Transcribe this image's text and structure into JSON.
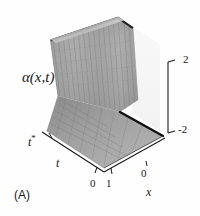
{
  "figure": {
    "caption": "(A)",
    "value_label": "α(x,t)",
    "background_color": "#fefefe",
    "axis_color": "#1a1a1a"
  },
  "axes": {
    "x": {
      "label": "x",
      "ticks": [
        "0"
      ],
      "front_tick": "1"
    },
    "t": {
      "label": "t",
      "ticks": [
        "0"
      ],
      "marker_label": "t*"
    },
    "value": {
      "label": "α(x,t)",
      "ticks": [
        "2",
        "-2"
      ],
      "range": [
        -2,
        2
      ]
    }
  },
  "chart_data": {
    "type": "surface",
    "title": "",
    "subtitle": "",
    "xlabel": "x",
    "ylabel": "t",
    "zlabel": "α(x,t)",
    "xlim": [
      0,
      1
    ],
    "ylim": [
      0,
      1
    ],
    "zlim": [
      -2,
      2
    ],
    "x_ticks": [
      0,
      1
    ],
    "y_ticks": [
      0
    ],
    "z_ticks": [
      -2,
      2
    ],
    "grid": true,
    "legend": "none",
    "annotations": [
      {
        "text": "t*",
        "axis": "t",
        "description": "time marker on t axis near back"
      },
      {
        "text": "(A)",
        "position": "bottom-left",
        "description": "panel label"
      }
    ],
    "surface": {
      "colorscale": [
        "#5a5a5a",
        "#9a9a9a",
        "#b8b8b8",
        "#d8d8d8"
      ],
      "ridge_color": "#1f1f1f",
      "front_edge_color": "#111111",
      "mesh_line_color": "#6e6e6e",
      "high_plateau_value": 2,
      "low_plateau_value": -2,
      "shock_position_x": 0.35
    },
    "series": [
      {
        "name": "alpha(x,t)",
        "x": [
          0.0,
          0.1,
          0.2,
          0.3,
          0.35,
          0.4,
          0.5,
          0.6,
          0.7,
          0.8,
          0.9,
          1.0
        ],
        "values": [
          2.0,
          2.0,
          2.0,
          1.95,
          0.2,
          -1.7,
          -1.95,
          -2.0,
          -2.0,
          -2.0,
          -2.0,
          -2.0
        ]
      }
    ]
  }
}
